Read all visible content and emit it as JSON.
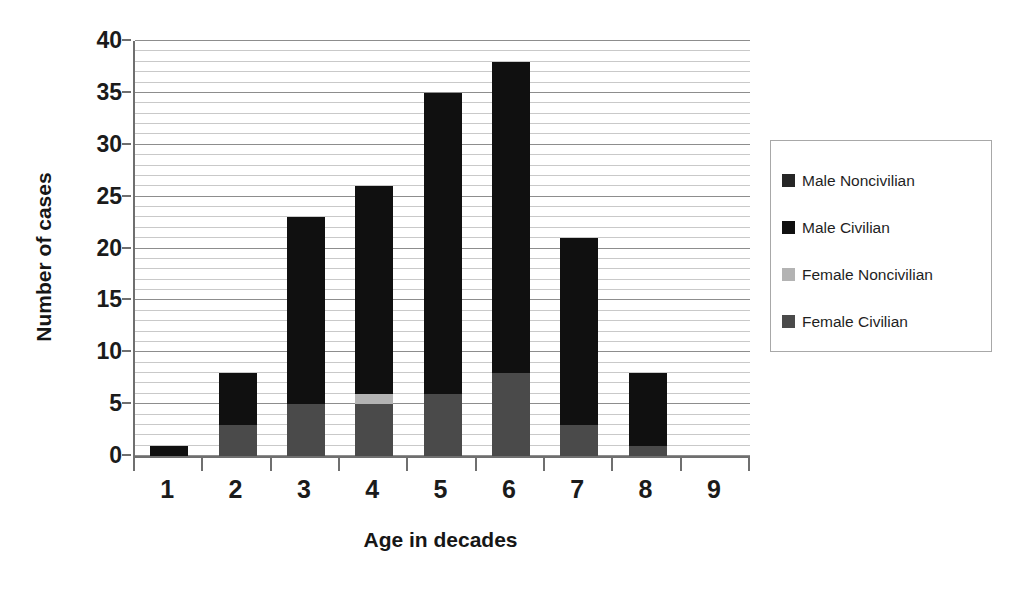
{
  "chart_data": {
    "type": "bar",
    "subtype": "stacked",
    "title": "",
    "xlabel": "Age in decades",
    "ylabel": "Number of cases",
    "categories": [
      "1",
      "2",
      "3",
      "4",
      "5",
      "6",
      "7",
      "8",
      "9"
    ],
    "series": [
      {
        "name": "Female Civilian",
        "color": "#4a4a4a",
        "values": [
          0,
          3,
          5,
          5,
          6,
          8,
          3,
          1,
          0
        ]
      },
      {
        "name": "Female Noncivilian",
        "color": "#b3b3b3",
        "values": [
          0,
          0,
          0,
          1,
          0,
          0,
          0,
          0,
          0
        ]
      },
      {
        "name": "Male Civilian",
        "color": "#101010",
        "values": [
          1,
          5,
          18,
          20,
          29,
          30,
          18,
          7,
          0
        ]
      },
      {
        "name": "Male Noncivilian",
        "color": "#262626",
        "values": [
          0,
          0,
          0,
          0,
          0,
          0,
          0,
          0,
          0
        ]
      }
    ],
    "totals": [
      1,
      8,
      23,
      26,
      35,
      38,
      21,
      8,
      0
    ],
    "ylim": [
      0,
      40
    ],
    "yticks": [
      0,
      5,
      10,
      15,
      20,
      25,
      30,
      35,
      40
    ],
    "ytick_labels": [
      "0",
      "5",
      "10",
      "15",
      "20",
      "25",
      "30",
      "35",
      "40"
    ],
    "minor_tick_step": 1,
    "major_tick_step": 5,
    "grid": true,
    "grid_axis": "y",
    "legend_position": "right",
    "legend_order": [
      "Male Noncivilian",
      "Male Civilian",
      "Female Noncivilian",
      "Female Civilian"
    ]
  },
  "legend": {
    "items": [
      {
        "label": "Male Noncivilian",
        "color": "#262626"
      },
      {
        "label": "Male Civilian",
        "color": "#101010"
      },
      {
        "label": "Female Noncivilian",
        "color": "#b3b3b3"
      },
      {
        "label": "Female Civilian",
        "color": "#4a4a4a"
      }
    ]
  },
  "axes": {
    "y_title": "Number of cases",
    "x_title": "Age in decades"
  },
  "colors": {
    "axis_line": "#6f6f6f",
    "gridline_minor": "#c9c9c9",
    "gridline_major": "#8d8d8d",
    "text": "#1b1b1b",
    "background": "#ffffff",
    "legend_border": "#a8a8a8"
  }
}
